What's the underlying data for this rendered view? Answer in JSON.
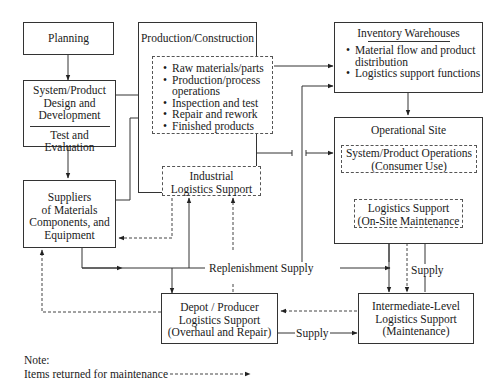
{
  "diagram": {
    "planning": "Planning",
    "design": {
      "line1": "System/Product",
      "line2": "Design and",
      "line3": "Development",
      "sub": "Test and Evaluation"
    },
    "suppliers": {
      "line1": "Suppliers",
      "line2": "of Materials",
      "line3": "Components, and",
      "line4": "Equipment"
    },
    "production": {
      "title": "Production/Construction",
      "items": [
        "Raw materials/parts",
        "Production/process operations",
        "Inspection and test",
        "Repair and rework",
        "Finished products"
      ],
      "ils": {
        "line1": "Industrial",
        "line2": "Logistics Support"
      }
    },
    "inventory": {
      "title": "Inventory Warehouses",
      "items": [
        "Material flow and product distribution",
        "Logistics support functions"
      ]
    },
    "operational": {
      "title": "Operational Site",
      "ops": {
        "line1": "System/Product Operations",
        "line2": "(Consumer Use)"
      },
      "ls": {
        "line1": "Logistics Support",
        "line2": "(On-Site Maintenance"
      }
    },
    "depot": {
      "line1": "Depot / Producer",
      "line2": "Logistics Support",
      "line3": "(Overhaul and Repair)"
    },
    "intermediate": {
      "line1": "Intermediate-Level",
      "line2": "Logistics Support",
      "line3": "(Maintenance)"
    },
    "labels": {
      "replenishment": "Replenishment Supply",
      "supply_right": "Supply",
      "supply_bottom": "Supply"
    },
    "note": {
      "title": "Note:",
      "text": "Items returned for maintenance"
    }
  }
}
